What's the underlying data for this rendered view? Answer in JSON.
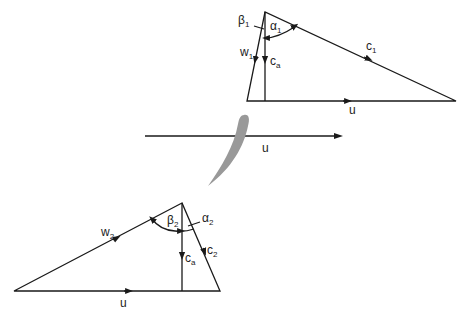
{
  "diagram": {
    "inlet_triangle": {
      "labels": {
        "beta": "β",
        "beta_sub": "1",
        "alpha": "α",
        "alpha_sub": "1",
        "w": "w",
        "w_sub": "1",
        "ca": "c",
        "ca_sub": "a",
        "c": "c",
        "c_sub": "1",
        "u": "u"
      }
    },
    "blade_row": {
      "u_label": "u",
      "blade_color": "#999999"
    },
    "outlet_triangle": {
      "labels": {
        "beta": "β",
        "beta_sub": "2",
        "alpha": "α",
        "alpha_sub": "2",
        "w": "w",
        "w_sub": "2",
        "ca": "c",
        "ca_sub": "a",
        "c": "c",
        "c_sub": "2",
        "u": "u"
      }
    },
    "colors": {
      "line": "#1a1a1a",
      "background": "#ffffff"
    }
  }
}
